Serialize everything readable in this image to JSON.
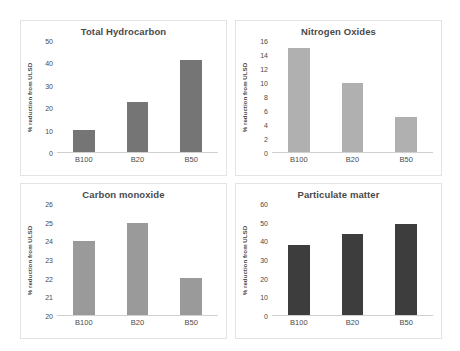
{
  "figure": {
    "background": "#ffffff",
    "panel_border": "#e3e3e3",
    "axis_color": "#d0d0d0",
    "text_color": "#4a4a4a"
  },
  "chart_data": [
    {
      "type": "bar",
      "title": "Total Hydrocarbon",
      "categories": [
        "B100",
        "B20",
        "B50"
      ],
      "values": [
        10,
        22.5,
        41.5
      ],
      "xlabel": "",
      "ylabel": "% reduction from ULSD",
      "ylim": [
        0,
        50
      ],
      "yticks": [
        0,
        10,
        20,
        30,
        40,
        50
      ],
      "bar_color": "#757575",
      "grid": false,
      "legend": "none"
    },
    {
      "type": "bar",
      "title": "Nitrogen Oxides",
      "categories": [
        "B100",
        "B20",
        "B50"
      ],
      "values": [
        15,
        10,
        5
      ],
      "xlabel": "",
      "ylabel": "% reduction from ULSD",
      "ylim": [
        0,
        16
      ],
      "yticks": [
        0,
        2,
        4,
        6,
        8,
        10,
        12,
        14,
        16
      ],
      "bar_color": "#b0b0b0",
      "grid": false,
      "legend": "none"
    },
    {
      "type": "bar",
      "title": "Carbon monoxide",
      "categories": [
        "B100",
        "B20",
        "B50"
      ],
      "values": [
        24,
        25,
        22
      ],
      "xlabel": "",
      "ylabel": "% reduction from ULSD",
      "ylim": [
        20,
        26
      ],
      "yticks": [
        20,
        21,
        22,
        23,
        24,
        25,
        26
      ],
      "bar_color": "#9a9a9a",
      "grid": false,
      "legend": "none"
    },
    {
      "type": "bar",
      "title": "Particulate matter",
      "categories": [
        "B100",
        "B20",
        "B50"
      ],
      "values": [
        38,
        44,
        49
      ],
      "xlabel": "",
      "ylabel": "% reduction from ULSD",
      "ylim": [
        0,
        60
      ],
      "yticks": [
        0,
        10,
        20,
        30,
        40,
        50,
        60
      ],
      "bar_color": "#3d3d3d",
      "grid": false,
      "legend": "none"
    }
  ]
}
